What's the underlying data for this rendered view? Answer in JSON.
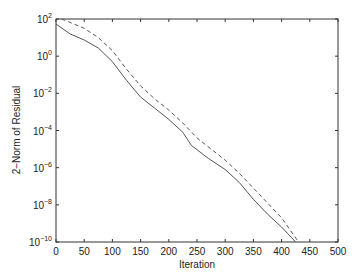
{
  "chart_data": {
    "type": "line",
    "title": "",
    "xlabel": "Iteration",
    "ylabel": "2−Norm of Residual",
    "xlim": [
      0,
      500
    ],
    "ylim": [
      1e-10,
      100
    ],
    "yscale": "log",
    "grid": false,
    "legend": null,
    "x_ticks": [
      "0",
      "50",
      "100",
      "150",
      "200",
      "250",
      "300",
      "350",
      "400",
      "450",
      "500"
    ],
    "y_ticks": [
      {
        "base": "10",
        "exp": "2",
        "value": 2
      },
      {
        "base": "10",
        "exp": "0",
        "value": 0
      },
      {
        "base": "10",
        "exp": "-2",
        "value": -2
      },
      {
        "base": "10",
        "exp": "-4",
        "value": -4
      },
      {
        "base": "10",
        "exp": "-6",
        "value": -6
      },
      {
        "base": "10",
        "exp": "-8",
        "value": -8
      },
      {
        "base": "10",
        "exp": "-10",
        "value": -10
      }
    ],
    "series": [
      {
        "name": "solid",
        "style": "solid",
        "color": "#555555",
        "x": [
          0,
          25,
          50,
          75,
          100,
          125,
          150,
          175,
          200,
          225,
          240,
          270,
          300,
          325,
          350,
          375,
          400,
          425
        ],
        "log10_y": [
          1.73,
          1.2,
          0.87,
          0.44,
          -0.3,
          -1.3,
          -2.2,
          -2.8,
          -3.4,
          -4.1,
          -4.8,
          -5.5,
          -6.1,
          -6.8,
          -7.7,
          -8.5,
          -9.2,
          -10.0
        ]
      },
      {
        "name": "dashed",
        "style": "dashed",
        "color": "#555555",
        "x": [
          10,
          30,
          50,
          75,
          100,
          125,
          150,
          175,
          200,
          225,
          250,
          275,
          300,
          325,
          350,
          375,
          400,
          430
        ],
        "log10_y": [
          2.0,
          1.75,
          1.5,
          1.0,
          0.3,
          -0.7,
          -1.6,
          -2.3,
          -2.9,
          -3.6,
          -4.4,
          -5.0,
          -5.6,
          -6.3,
          -7.1,
          -7.9,
          -8.7,
          -10.0
        ]
      }
    ]
  }
}
